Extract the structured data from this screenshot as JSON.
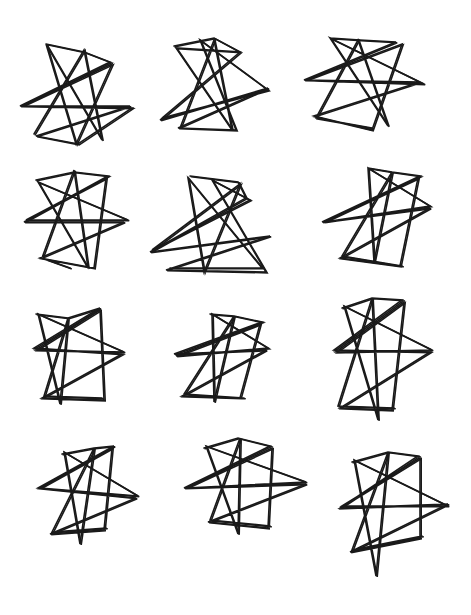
{
  "drawing": {
    "description": "Twelve hand-drawn spiky scribble stars arranged in a 3-column by 4-row grid",
    "ink_color": "#1a1a1a",
    "background": "#ffffff",
    "stars": [
      {
        "cx": 75,
        "cy": 95,
        "points": [
          [
            46,
            44
          ],
          [
            84,
            52
          ],
          [
            110,
            62
          ],
          [
            20,
            106
          ],
          [
            130,
            106
          ],
          [
            36,
            136
          ],
          [
            78,
            144
          ],
          [
            132,
            108
          ],
          [
            22,
            106
          ],
          [
            112,
            64
          ],
          [
            76,
            144
          ],
          [
            46,
            44
          ],
          [
            102,
            140
          ],
          [
            84,
            50
          ],
          [
            34,
            134
          ]
        ]
      },
      {
        "cx": 215,
        "cy": 88,
        "points": [
          [
            174,
            46
          ],
          [
            214,
            38
          ],
          [
            240,
            52
          ],
          [
            160,
            120
          ],
          [
            268,
            88
          ],
          [
            178,
            128
          ],
          [
            236,
            130
          ],
          [
            200,
            40
          ],
          [
            268,
            90
          ],
          [
            162,
            118
          ],
          [
            240,
            52
          ],
          [
            176,
            48
          ],
          [
            232,
            130
          ],
          [
            214,
            40
          ],
          [
            180,
            128
          ]
        ]
      },
      {
        "cx": 370,
        "cy": 85,
        "points": [
          [
            330,
            38
          ],
          [
            360,
            40
          ],
          [
            396,
            42
          ],
          [
            304,
            80
          ],
          [
            420,
            82
          ],
          [
            314,
            116
          ],
          [
            372,
            130
          ],
          [
            402,
            44
          ],
          [
            306,
            80
          ],
          [
            424,
            84
          ],
          [
            330,
            38
          ],
          [
            388,
            126
          ],
          [
            358,
            40
          ],
          [
            316,
            118
          ],
          [
            372,
            128
          ]
        ]
      },
      {
        "cx": 75,
        "cy": 220,
        "points": [
          [
            36,
            180
          ],
          [
            74,
            172
          ],
          [
            108,
            176
          ],
          [
            24,
            222
          ],
          [
            124,
            222
          ],
          [
            40,
            258
          ],
          [
            94,
            268
          ],
          [
            106,
            178
          ],
          [
            26,
            220
          ],
          [
            128,
            220
          ],
          [
            38,
            182
          ],
          [
            88,
            268
          ],
          [
            74,
            170
          ],
          [
            42,
            258
          ],
          [
            70,
            268
          ]
        ]
      },
      {
        "cx": 215,
        "cy": 225,
        "points": [
          [
            190,
            176
          ],
          [
            238,
            182
          ],
          [
            246,
            198
          ],
          [
            150,
            252
          ],
          [
            270,
            236
          ],
          [
            166,
            270
          ],
          [
            266,
            272
          ],
          [
            212,
            180
          ],
          [
            250,
            200
          ],
          [
            152,
            250
          ],
          [
            240,
            184
          ],
          [
            204,
            272
          ],
          [
            188,
            178
          ],
          [
            262,
            268
          ],
          [
            170,
            268
          ]
        ]
      },
      {
        "cx": 375,
        "cy": 215,
        "points": [
          [
            368,
            168
          ],
          [
            392,
            172
          ],
          [
            420,
            176
          ],
          [
            322,
            222
          ],
          [
            430,
            208
          ],
          [
            340,
            258
          ],
          [
            400,
            266
          ],
          [
            418,
            178
          ],
          [
            324,
            222
          ],
          [
            430,
            206
          ],
          [
            368,
            168
          ],
          [
            374,
            262
          ],
          [
            392,
            172
          ],
          [
            342,
            256
          ],
          [
            402,
            266
          ]
        ]
      },
      {
        "cx": 75,
        "cy": 355,
        "points": [
          [
            36,
            314
          ],
          [
            68,
            318
          ],
          [
            100,
            308
          ],
          [
            34,
            348
          ],
          [
            122,
            354
          ],
          [
            42,
            398
          ],
          [
            104,
            400
          ],
          [
            100,
            310
          ],
          [
            36,
            350
          ],
          [
            124,
            352
          ],
          [
            38,
            314
          ],
          [
            60,
            404
          ],
          [
            68,
            318
          ],
          [
            44,
            396
          ],
          [
            102,
            398
          ]
        ]
      },
      {
        "cx": 220,
        "cy": 355,
        "points": [
          [
            210,
            314
          ],
          [
            234,
            316
          ],
          [
            262,
            322
          ],
          [
            174,
            354
          ],
          [
            266,
            350
          ],
          [
            182,
            396
          ],
          [
            240,
            398
          ],
          [
            260,
            324
          ],
          [
            176,
            356
          ],
          [
            268,
            348
          ],
          [
            212,
            314
          ],
          [
            214,
            402
          ],
          [
            234,
            316
          ],
          [
            184,
            394
          ],
          [
            244,
            398
          ]
        ]
      },
      {
        "cx": 380,
        "cy": 355,
        "points": [
          [
            342,
            308
          ],
          [
            372,
            298
          ],
          [
            402,
            300
          ],
          [
            334,
            350
          ],
          [
            430,
            352
          ],
          [
            340,
            408
          ],
          [
            392,
            410
          ],
          [
            404,
            302
          ],
          [
            336,
            352
          ],
          [
            432,
            350
          ],
          [
            344,
            306
          ],
          [
            378,
            420
          ],
          [
            372,
            298
          ],
          [
            338,
            406
          ],
          [
            394,
            408
          ]
        ]
      },
      {
        "cx": 85,
        "cy": 490,
        "points": [
          [
            62,
            454
          ],
          [
            94,
            448
          ],
          [
            114,
            446
          ],
          [
            38,
            488
          ],
          [
            136,
            498
          ],
          [
            50,
            534
          ],
          [
            104,
            530
          ],
          [
            112,
            448
          ],
          [
            40,
            488
          ],
          [
            138,
            496
          ],
          [
            64,
            452
          ],
          [
            80,
            544
          ],
          [
            94,
            448
          ],
          [
            52,
            532
          ],
          [
            106,
            528
          ]
        ]
      },
      {
        "cx": 245,
        "cy": 485,
        "points": [
          [
            204,
            448
          ],
          [
            238,
            438
          ],
          [
            270,
            446
          ],
          [
            184,
            488
          ],
          [
            306,
            484
          ],
          [
            208,
            522
          ],
          [
            268,
            528
          ],
          [
            272,
            448
          ],
          [
            186,
            488
          ],
          [
            306,
            482
          ],
          [
            206,
            446
          ],
          [
            238,
            534
          ],
          [
            240,
            438
          ],
          [
            210,
            520
          ],
          [
            270,
            526
          ]
        ]
      },
      {
        "cx": 390,
        "cy": 505,
        "points": [
          [
            352,
            462
          ],
          [
            388,
            452
          ],
          [
            418,
            456
          ],
          [
            340,
            508
          ],
          [
            448,
            504
          ],
          [
            350,
            552
          ],
          [
            420,
            538
          ],
          [
            420,
            458
          ],
          [
            342,
            506
          ],
          [
            448,
            506
          ],
          [
            354,
            460
          ],
          [
            376,
            576
          ],
          [
            388,
            452
          ],
          [
            352,
            550
          ],
          [
            422,
            536
          ]
        ]
      }
    ]
  }
}
